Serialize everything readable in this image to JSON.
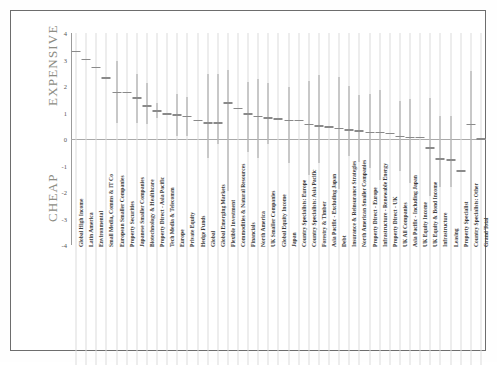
{
  "side_labels": {
    "top": "EXPENSIVE",
    "bottom": "CHEAP"
  },
  "chart_data": {
    "type": "scatter",
    "title": "",
    "subtitle": "",
    "xlabel": "",
    "ylabel": "",
    "ylim": [
      -4,
      4
    ],
    "yticks": [
      4,
      3,
      2,
      1,
      0,
      -1,
      -2,
      -3,
      -4
    ],
    "ytick_labels": [
      "4",
      "3",
      "2",
      "1",
      "0",
      "-1",
      "-2",
      "-3",
      "-4"
    ],
    "grid": true,
    "legend": "none",
    "annotations": [
      "EXPENSIVE",
      "CHEAP"
    ],
    "categories": [
      "Global High Income",
      "Latin America",
      "Environmental",
      "Small Media, Comms & IT Co",
      "European Smaller Companies",
      "Property Securities",
      "Japanese Smaller Companies",
      "Biotechnology & Healthcare",
      "Property Direct - Asia Pacific",
      "Tech Media & Telecomm",
      "Europe",
      "Private Equity",
      "Hedge Funds",
      "Global",
      "Global Emerging Markets",
      "Flexible Investment",
      "Commodities & Natural Resources",
      "Financials",
      "North America",
      "UK Smaller Companies",
      "Global Equity Income",
      "Japan",
      "Country Specialists: Europe",
      "Country Specialists: Asia Pacific",
      "Forestry & Timber",
      "Asia Pacific - Excluding Japan",
      "Debt",
      "Insurance & Reinsurance Strategies",
      "North American Smaller Companies",
      "Property Direct - Europe",
      "Infrastructure - Renewable Energy",
      "Property Direct - UK",
      "UK All Companies",
      "Asia Pacific - Including Japan",
      "UK Equity Income",
      "UK Equity & Bond Income",
      "Infrastructure",
      "Leasing",
      "Property Specialist",
      "Country Specialists: Other",
      "Grand Total"
    ],
    "series": [
      {
        "name": "Median",
        "values": [
          3.3,
          3.0,
          2.7,
          2.3,
          1.75,
          1.75,
          1.55,
          1.25,
          1.05,
          0.95,
          0.9,
          0.85,
          0.7,
          0.6,
          0.6,
          1.35,
          1.15,
          0.95,
          0.85,
          0.8,
          0.75,
          0.7,
          0.7,
          0.55,
          0.5,
          0.45,
          0.4,
          0.35,
          0.3,
          0.25,
          0.25,
          0.2,
          0.1,
          0.05,
          0.05,
          -0.35,
          -0.75,
          -0.8,
          -1.2,
          0.55,
          0.0
        ]
      },
      {
        "name": "Range high",
        "values": [
          3.3,
          3.0,
          2.7,
          2.3,
          2.95,
          1.75,
          2.45,
          2.1,
          1.35,
          0.95,
          1.7,
          1.6,
          0.7,
          2.45,
          2.45,
          2.6,
          1.15,
          2.15,
          2.25,
          2.1,
          0.8,
          1.95,
          0.7,
          2.2,
          2.4,
          0.4,
          2.35,
          2.0,
          1.65,
          1.7,
          1.85,
          0.2,
          1.45,
          1.5,
          0.05,
          1.55,
          0.85,
          0.85,
          -1.2,
          2.55,
          0.0
        ]
      },
      {
        "name": "Range low",
        "values": [
          3.3,
          3.0,
          2.7,
          2.3,
          0.6,
          1.75,
          0.6,
          0.55,
          0.8,
          0.95,
          0.1,
          0.1,
          0.7,
          -0.7,
          -0.2,
          -1.95,
          1.15,
          -0.5,
          -0.7,
          -0.2,
          0.8,
          -0.9,
          0.7,
          -1.35,
          -0.9,
          0.45,
          -1.9,
          -0.65,
          -0.85,
          -1.1,
          -1.55,
          0.2,
          -1.2,
          -1.65,
          0.05,
          -2.15,
          -1.8,
          -1.8,
          -1.2,
          -2.7,
          0.0
        ]
      }
    ]
  }
}
